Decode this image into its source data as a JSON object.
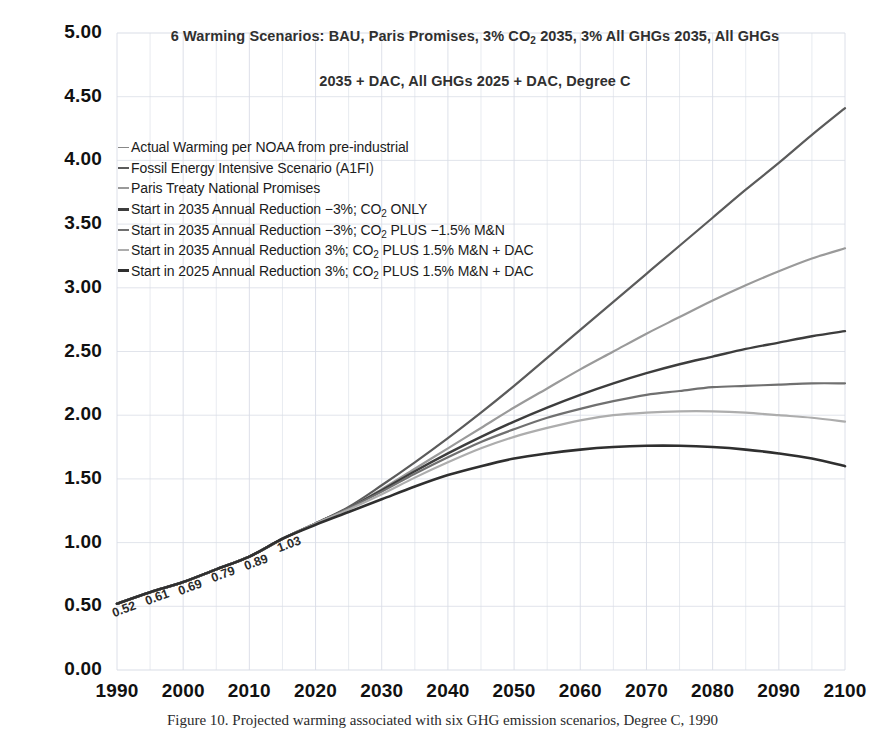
{
  "chart_data": {
    "type": "line",
    "title_line1": "6 Warming Scenarios: BAU, Paris Promises, 3% CO",
    "title_line1_sub": "2",
    "title_line1_rest": " 2035, 3% All GHGs 2035, All GHGs",
    "title_line2": "2035 + DAC, All GHGs 2025 + DAC, Degree C",
    "xlabel": "",
    "ylabel": "",
    "xlim": [
      1990,
      2100
    ],
    "ylim": [
      0.0,
      5.0
    ],
    "grid": true,
    "legend_position": "upper-left-inside",
    "x_ticks": [
      "1990",
      "2000",
      "2010",
      "2020",
      "2030",
      "2040",
      "2050",
      "2060",
      "2070",
      "2080",
      "2090",
      "2100"
    ],
    "y_ticks": [
      "0.00",
      "0.50",
      "1.00",
      "1.50",
      "2.00",
      "2.50",
      "3.00",
      "3.50",
      "4.00",
      "4.50",
      "5.00"
    ],
    "x": [
      1990,
      1995,
      2000,
      2005,
      2010,
      2015,
      2020,
      2025,
      2030,
      2035,
      2040,
      2045,
      2050,
      2055,
      2060,
      2065,
      2070,
      2075,
      2080,
      2085,
      2090,
      2095,
      2100
    ],
    "series": [
      {
        "name": "Actual Warming per NOAA from pre-industrial",
        "color": "#4a4a4a",
        "width": 2.6,
        "values": [
          0.52,
          0.61,
          0.69,
          0.79,
          0.89,
          1.03,
          null,
          null,
          null,
          null,
          null,
          null,
          null,
          null,
          null,
          null,
          null,
          null,
          null,
          null,
          null,
          null,
          null
        ],
        "data_labels": [
          {
            "x": 1990,
            "y": 0.52,
            "text": "0.52"
          },
          {
            "x": 1995,
            "y": 0.61,
            "text": "0.61"
          },
          {
            "x": 2000,
            "y": 0.69,
            "text": "0.69"
          },
          {
            "x": 2005,
            "y": 0.79,
            "text": "0.79"
          },
          {
            "x": 2010,
            "y": 0.89,
            "text": "0.89"
          },
          {
            "x": 2015,
            "y": 1.03,
            "text": "1.03"
          }
        ]
      },
      {
        "name": "Fossil Energy Intensive Scenario (A1FI)",
        "color": "#5b5b5b",
        "width": 2.2,
        "values": [
          0.52,
          0.61,
          0.69,
          0.79,
          0.89,
          1.03,
          1.15,
          1.28,
          1.45,
          1.63,
          1.82,
          2.02,
          2.23,
          2.45,
          2.67,
          2.89,
          3.11,
          3.33,
          3.55,
          3.77,
          3.98,
          4.2,
          4.41
        ]
      },
      {
        "name": "Paris Treaty National Promises",
        "color": "#9a9a9a",
        "width": 2.2,
        "values": [
          0.52,
          0.61,
          0.69,
          0.79,
          0.89,
          1.03,
          1.15,
          1.27,
          1.42,
          1.58,
          1.74,
          1.9,
          2.06,
          2.21,
          2.36,
          2.5,
          2.64,
          2.77,
          2.9,
          3.02,
          3.13,
          3.23,
          3.31
        ]
      },
      {
        "name": "Start in 2035 Annual Reduction -3%; CO2 ONLY",
        "color": "#3d3d3d",
        "width": 2.4,
        "values": [
          0.52,
          0.61,
          0.69,
          0.79,
          0.89,
          1.03,
          1.15,
          1.27,
          1.41,
          1.56,
          1.7,
          1.83,
          1.95,
          2.06,
          2.16,
          2.25,
          2.33,
          2.4,
          2.46,
          2.52,
          2.57,
          2.62,
          2.66
        ]
      },
      {
        "name": "Start in 2035 Annual Reduction -3%; CO2 PLUS -1.5% M&N",
        "color": "#707070",
        "width": 2.2,
        "values": [
          0.52,
          0.61,
          0.69,
          0.79,
          0.89,
          1.03,
          1.15,
          1.27,
          1.4,
          1.54,
          1.67,
          1.79,
          1.89,
          1.98,
          2.05,
          2.11,
          2.16,
          2.19,
          2.22,
          2.23,
          2.24,
          2.25,
          2.25
        ]
      },
      {
        "name": "Start in 2035 Annual Reduction 3%; CO2 PLUS 1.5% M&N + DAC",
        "color": "#adadad",
        "width": 2.2,
        "values": [
          0.52,
          0.61,
          0.69,
          0.79,
          0.89,
          1.03,
          1.15,
          1.26,
          1.38,
          1.51,
          1.63,
          1.74,
          1.83,
          1.9,
          1.96,
          2.0,
          2.02,
          2.03,
          2.03,
          2.02,
          2.0,
          1.98,
          1.95
        ]
      },
      {
        "name": "Start in 2025 Annual Reduction 3%; CO2 PLUS 1.5% M&N + DAC",
        "color": "#2f2f2f",
        "width": 2.6,
        "values": [
          0.52,
          0.61,
          0.69,
          0.79,
          0.89,
          1.03,
          1.14,
          1.24,
          1.34,
          1.44,
          1.53,
          1.6,
          1.66,
          1.7,
          1.73,
          1.75,
          1.76,
          1.76,
          1.75,
          1.73,
          1.7,
          1.66,
          1.6
        ]
      }
    ]
  },
  "legend": {
    "items": [
      {
        "label_pre": "Actual Warming per NOAA from pre-industrial",
        "sub": "",
        "label_post": "",
        "color": "#888888",
        "width": 1.6
      },
      {
        "label_pre": "Fossil Energy Intensive Scenario (A1FI)",
        "sub": "",
        "label_post": "",
        "color": "#5b5b5b",
        "width": 2.2
      },
      {
        "label_pre": "Paris Treaty National Promises",
        "sub": "",
        "label_post": "",
        "color": "#9a9a9a",
        "width": 2.2
      },
      {
        "label_pre": "Start in 2035 Annual Reduction −3%; CO",
        "sub": "2",
        "label_post": " ONLY",
        "color": "#3d3d3d",
        "width": 3.0
      },
      {
        "label_pre": "Start in 2035 Annual Reduction −3%; CO",
        "sub": "2",
        "label_post": " PLUS −1.5% M&N",
        "color": "#707070",
        "width": 2.6
      },
      {
        "label_pre": "Start in 2035 Annual Reduction 3%; CO",
        "sub": "2",
        "label_post": " PLUS 1.5% M&N + DAC",
        "color": "#adadad",
        "width": 2.2
      },
      {
        "label_pre": "Start in 2025 Annual Reduction 3%; CO",
        "sub": "2",
        "label_post": " PLUS 1.5% M&N + DAC",
        "color": "#2f2f2f",
        "width": 3.0
      }
    ]
  },
  "caption": {
    "text": "Figure 10.  Projected warming associated with six GHG emission scenarios, Degree C, 1990"
  },
  "axes": {
    "y_ticks": [
      "5.00",
      "4.50",
      "4.00",
      "3.50",
      "3.00",
      "2.50",
      "2.00",
      "1.50",
      "1.00",
      "0.50",
      "0.00"
    ],
    "x_ticks": [
      "1990",
      "2000",
      "2010",
      "2020",
      "2030",
      "2040",
      "2050",
      "2060",
      "2070",
      "2080",
      "2090",
      "2100"
    ]
  },
  "colors": {
    "grid": "#d9dde6",
    "axis_text": "#111111",
    "title_text": "#303030"
  }
}
